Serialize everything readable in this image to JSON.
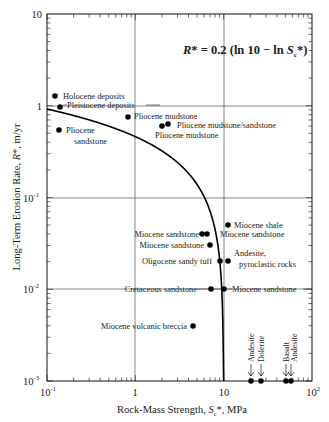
{
  "chart_data": {
    "type": "scatter",
    "title": "",
    "equation": "R* = 0.2 (ln 10 − ln Sc*)",
    "xlabel": "Rock-Mass Strength, Sc*, MPa",
    "ylabel": "Long-Term Erosion Rate, R*, m/yr",
    "xscale": "log",
    "yscale": "log",
    "xlim": [
      0.1,
      100
    ],
    "ylim": [
      0.001,
      10
    ],
    "x_ticks": [
      "10⁻¹",
      "1",
      "10",
      "10²"
    ],
    "y_ticks": [
      "10",
      "1",
      "10⁻¹",
      "10⁻²",
      "10⁻³"
    ],
    "grid": "major gridlines at x=1, x=10, y=1, y=0.1, y=0.01",
    "curve": {
      "name": "R* = 0.2 (ln 10 − ln Sc*)",
      "a": 0.2,
      "Sc_max": 10
    },
    "points": [
      {
        "label": "Holocene deposits",
        "x": 0.12,
        "y": 1.27
      },
      {
        "label": "Pleistocene deposits",
        "x": 0.14,
        "y": 0.93
      },
      {
        "label": "Pliocene sandstone",
        "x": 0.137,
        "y": 0.53
      },
      {
        "label": "Pliocene mudstone",
        "x": 0.82,
        "y": 0.75
      },
      {
        "label": "Pliocene mudstone",
        "x": 2.0,
        "y": 0.62
      },
      {
        "label": "Pliocene mudstone/sandstone",
        "x": 2.3,
        "y": 0.66
      },
      {
        "label": "Miocene shale",
        "x": 11.2,
        "y": 0.05
      },
      {
        "label": "Miocene sandstone",
        "x": 5.7,
        "y": 0.04
      },
      {
        "label": "Miocene sandstone",
        "x": 6.4,
        "y": 0.04
      },
      {
        "label": "Miocene sandstone",
        "x": 7.0,
        "y": 0.03
      },
      {
        "label": "Oligocene sandy tuff",
        "x": 9.2,
        "y": 0.02
      },
      {
        "label": "Andesite, pyroclastic rocks",
        "x": 11.2,
        "y": 0.02
      },
      {
        "label": "Cretaceous sandstone",
        "x": 7.2,
        "y": 0.01
      },
      {
        "label": "Miocene sandstone",
        "x": 10.0,
        "y": 0.01
      },
      {
        "label": "Miocene volcanic breccia",
        "x": 4.5,
        "y": 0.0039
      },
      {
        "label": "Andesite",
        "x": 20,
        "y": 0.001
      },
      {
        "label": "Dolerite",
        "x": 25,
        "y": 0.001
      },
      {
        "label": "Basalt",
        "x": 50,
        "y": 0.001
      },
      {
        "label": "Andesite",
        "x": 55,
        "y": 0.001
      }
    ]
  },
  "labels": {
    "holocene": "Holocene deposits",
    "pleistocene": "Pleistocene deposits",
    "pliocene_sand_1": "Pliocene",
    "pliocene_sand_2": "sandstone",
    "pliocene_mud_a": "Pliocene mudstone",
    "pliocene_mudsand": "Pliocene mudstone/sandstone",
    "pliocene_mud_b": "Pliocene mudstone",
    "miocene_shale": "Miocene shale",
    "miocene_sand_r": "Miocene sandstone",
    "miocene_sand_l1": "Miocene sandstone",
    "miocene_sand_l2": "Miocene sandstone",
    "oligocene": "Oligocene sandy tuff",
    "andesite_pyro_1": "Andesite,",
    "andesite_pyro_2": "pyroclastic rocks",
    "cretaceous": "Cretaceous sandstone",
    "miocene_sand_r2": "Miocene sandstone",
    "volcanic_breccia": "Miocene volcanic breccia",
    "andesite_1": "Andesite",
    "dolerite": "Dolerite",
    "basalt": "Basalt",
    "andesite_2": "Andesite"
  },
  "axes": {
    "x_ticks": {
      "t0": "10",
      "t0e": "-1",
      "t1": "1",
      "t2": "10",
      "t3": "10",
      "t3e": "2"
    },
    "y_ticks": {
      "t10": "10",
      "t1": "1",
      "tm1": "10",
      "tm1e": "-1",
      "tm2": "10",
      "tm2e": "-2",
      "tm3": "10",
      "tm3e": "-3"
    },
    "xlabel_pre": "Rock-Mass Strength, ",
    "xlabel_sym": "S",
    "xlabel_sub": "c",
    "xlabel_post": "*, MPa",
    "ylabel_pre": "Long-Term Erosion Rate, ",
    "ylabel_sym": "R",
    "ylabel_post": "*, m/yr"
  },
  "equation": {
    "lhs": "R",
    "mid": "* = 0.2 (ln 10 − ln ",
    "sym": "S",
    "sub": "c",
    "end": "*)"
  }
}
